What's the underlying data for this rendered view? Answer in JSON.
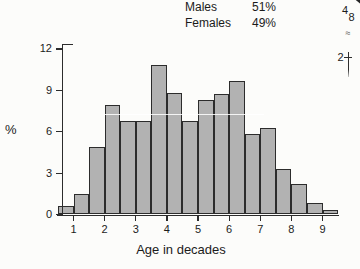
{
  "legend": {
    "rows": [
      {
        "label": "Males",
        "value": "51%"
      },
      {
        "label": "Females",
        "value": "49%"
      }
    ]
  },
  "chart_data": {
    "type": "bar",
    "subtype": "histogram",
    "title": "",
    "xlabel": "Age in decades",
    "ylabel": "%",
    "bins": {
      "start": 0.5,
      "end": 9.5,
      "width": 0.5
    },
    "bin_centers": [
      0.75,
      1.25,
      1.75,
      2.25,
      2.75,
      3.25,
      3.75,
      4.25,
      4.75,
      5.25,
      5.75,
      6.25,
      6.75,
      7.25,
      7.75,
      8.25,
      8.75,
      9.25
    ],
    "values": [
      0.6,
      1.5,
      4.9,
      7.9,
      6.8,
      6.8,
      10.8,
      8.8,
      6.8,
      8.3,
      8.7,
      9.7,
      5.8,
      6.3,
      3.3,
      2.2,
      0.8,
      0.3
    ],
    "x_ticks": [
      1,
      2,
      3,
      4,
      5,
      6,
      7,
      8,
      9
    ],
    "y_ticks": [
      0,
      3,
      6,
      9,
      12
    ],
    "ylim": [
      0,
      12
    ],
    "grid": false,
    "legend_position": "top-right"
  },
  "edge_fragments": {
    "top_a": "4",
    "top_b": "8",
    "squiggle": "≈",
    "axis_label": "2"
  },
  "colors": {
    "bar_fill": "#b2b2b2",
    "bar_border": "#2c2c2c",
    "axis": "#2c2c2c",
    "text": "#1b1b1b",
    "background": "#fcfcfa"
  }
}
